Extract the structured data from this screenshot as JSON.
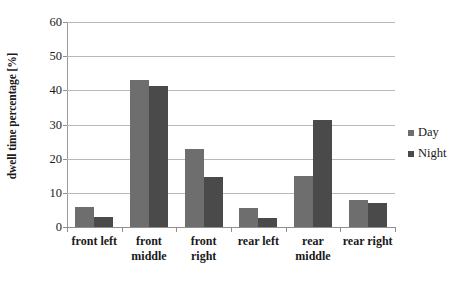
{
  "chart_data": {
    "type": "bar",
    "title": "",
    "xlabel": "",
    "ylabel": "dwell time percentage [%]",
    "ylim": [
      0,
      60
    ],
    "ytick_step": 10,
    "yticks": [
      0,
      10,
      20,
      30,
      40,
      50,
      60
    ],
    "grid": true,
    "legend_position": "right",
    "categories": [
      "front left",
      "front middle",
      "front right",
      "rear left",
      "rear middle",
      "rear right"
    ],
    "category_lines": [
      [
        "front left"
      ],
      [
        "front",
        "middle"
      ],
      [
        "front",
        "right"
      ],
      [
        "rear left"
      ],
      [
        "rear",
        "middle"
      ],
      [
        "rear right"
      ]
    ],
    "series": [
      {
        "name": "Day",
        "color": "#6e6e6e",
        "values": [
          6.0,
          43.0,
          22.7,
          5.7,
          15.0,
          7.9
        ]
      },
      {
        "name": "Night",
        "color": "#4a4a4a",
        "values": [
          2.8,
          41.2,
          14.7,
          2.7,
          31.3,
          7.0
        ]
      }
    ]
  },
  "legend": {
    "items": [
      {
        "label": "Day",
        "color": "#6e6e6e"
      },
      {
        "label": "Night",
        "color": "#4a4a4a"
      }
    ]
  },
  "axes": {
    "y_title": "dwell time percentage [%]"
  }
}
